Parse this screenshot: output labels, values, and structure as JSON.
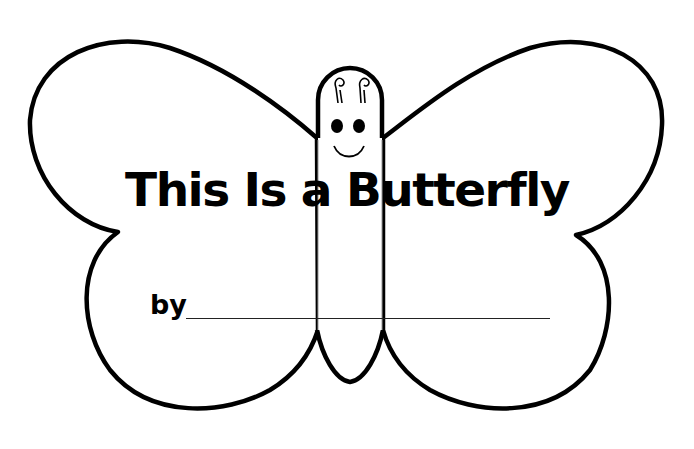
{
  "worksheet": {
    "title": "This Is a Butterfly",
    "by_label": "by",
    "colors": {
      "ink": "#000000",
      "paper": "#ffffff",
      "guide_line": "#999999"
    }
  }
}
